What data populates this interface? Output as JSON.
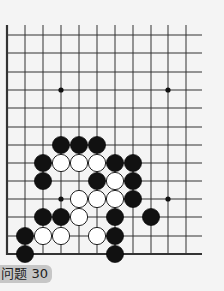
{
  "problem": {
    "label": "问题 30"
  },
  "board": {
    "background": "#f4f4f4",
    "line_color": "#333333",
    "grid": {
      "columns_x": [
        7,
        25,
        43,
        61,
        79,
        97,
        115,
        133,
        151,
        168,
        186
      ],
      "rows_y": [
        35,
        53,
        72,
        90,
        108,
        127,
        145,
        163,
        181,
        199,
        217,
        236,
        254
      ],
      "top_open_y": 25,
      "right_open_x": 202,
      "left_edge": true,
      "bottom_edge": true
    },
    "star_points": [
      [
        3,
        3
      ],
      [
        9,
        3
      ],
      [
        3,
        9
      ],
      [
        9,
        9
      ]
    ],
    "stones": [
      {
        "color": "black",
        "col": 3,
        "row": 6
      },
      {
        "color": "black",
        "col": 4,
        "row": 6
      },
      {
        "color": "black",
        "col": 5,
        "row": 6
      },
      {
        "color": "black",
        "col": 2,
        "row": 7
      },
      {
        "color": "white",
        "col": 3,
        "row": 7
      },
      {
        "color": "white",
        "col": 4,
        "row": 7
      },
      {
        "color": "white",
        "col": 5,
        "row": 7
      },
      {
        "color": "black",
        "col": 6,
        "row": 7
      },
      {
        "color": "black",
        "col": 7,
        "row": 7
      },
      {
        "color": "black",
        "col": 2,
        "row": 8
      },
      {
        "color": "black",
        "col": 5,
        "row": 8
      },
      {
        "color": "white",
        "col": 6,
        "row": 8
      },
      {
        "color": "black",
        "col": 7,
        "row": 8
      },
      {
        "color": "white",
        "col": 4,
        "row": 9
      },
      {
        "color": "white",
        "col": 5,
        "row": 9
      },
      {
        "color": "white",
        "col": 6,
        "row": 9
      },
      {
        "color": "black",
        "col": 7,
        "row": 9
      },
      {
        "color": "black",
        "col": 2,
        "row": 10
      },
      {
        "color": "black",
        "col": 3,
        "row": 10
      },
      {
        "color": "white",
        "col": 4,
        "row": 10
      },
      {
        "color": "black",
        "col": 6,
        "row": 10
      },
      {
        "color": "black",
        "col": 8,
        "row": 10
      },
      {
        "color": "black",
        "col": 1,
        "row": 11
      },
      {
        "color": "white",
        "col": 2,
        "row": 11
      },
      {
        "color": "white",
        "col": 3,
        "row": 11
      },
      {
        "color": "white",
        "col": 5,
        "row": 11
      },
      {
        "color": "black",
        "col": 6,
        "row": 11
      },
      {
        "color": "black",
        "col": 1,
        "row": 12
      },
      {
        "color": "black",
        "col": 6,
        "row": 12
      }
    ]
  }
}
